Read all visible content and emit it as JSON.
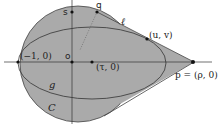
{
  "diagram": {
    "colors": {
      "fill": "#aaaaaa",
      "stroke": "#333333",
      "background": "#ffffff"
    },
    "labels": {
      "s": "s",
      "q": "q",
      "ell": "ℓ",
      "uv": "(u, v)",
      "minus_one": "(−1, 0)",
      "o": "o",
      "tau": "(τ, 0)",
      "p": "p = (ρ, 0)",
      "g": "g",
      "C": "C"
    }
  }
}
